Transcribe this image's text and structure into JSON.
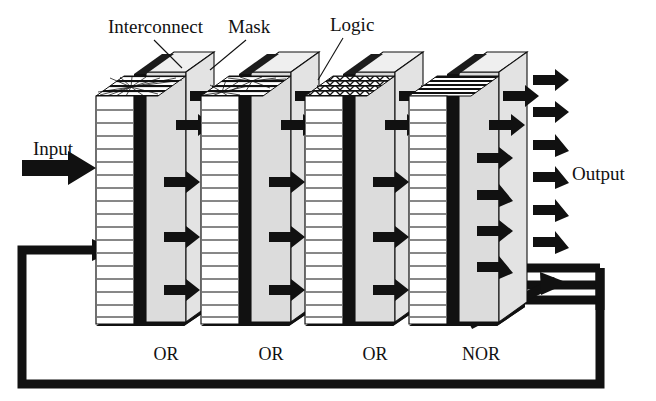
{
  "figure": {
    "type": "schematic-diagram",
    "background_color": "#ffffff",
    "ink_color": "#111111"
  },
  "callouts": [
    {
      "id": "interconnect",
      "label": "Interconnect",
      "x": 108,
      "y": 33,
      "leader": {
        "x1": 154,
        "y1": 40,
        "x2": 182,
        "y2": 68
      }
    },
    {
      "id": "mask",
      "label": "Mask",
      "x": 228,
      "y": 33,
      "leader": {
        "x1": 246,
        "y1": 40,
        "x2": 210,
        "y2": 70
      }
    },
    {
      "id": "logic",
      "label": "Logic",
      "x": 330,
      "y": 31,
      "leader": {
        "x1": 343,
        "y1": 38,
        "x2": 318,
        "y2": 78
      }
    }
  ],
  "ports": {
    "input": {
      "label": "Input",
      "x": 33,
      "y": 155
    },
    "output": {
      "label": "Output",
      "x": 568,
      "y": 180
    }
  },
  "stages": [
    {
      "index": 1,
      "gate": "OR",
      "gate_x": 166,
      "gate_y": 357,
      "interconnect_pattern": "single-starburst",
      "front_lines": 17,
      "logic_fill": "#dcdcdc",
      "mask_fill": "#111111"
    },
    {
      "index": 2,
      "gate": "OR",
      "gate_x": 271,
      "gate_y": 357,
      "interconnect_pattern": "double-starburst",
      "front_lines": 17,
      "logic_fill": "#dcdcdc",
      "mask_fill": "#111111"
    },
    {
      "index": 3,
      "gate": "OR",
      "gate_x": 375,
      "gate_y": 357,
      "interconnect_pattern": "dense-crossing",
      "front_lines": 17,
      "logic_fill": "#dcdcdc",
      "mask_fill": "#111111"
    },
    {
      "index": 4,
      "gate": "NOR",
      "gate_x": 478,
      "gate_y": 357,
      "interconnect_pattern": "dense-horizontal",
      "front_lines": 17,
      "logic_fill": "#dcdcdc",
      "mask_fill": "#111111"
    }
  ],
  "feedback": {
    "description": "Output fed back to input of first stage",
    "path_color": "#111111",
    "stroke_width": 9
  },
  "colors": {
    "panel_face": "#ffffff",
    "logic_gray": "#dcdcdc",
    "mask_black": "#111111",
    "shadow_black": "#111111",
    "arrow_black": "#111111",
    "outline": "#111111"
  }
}
